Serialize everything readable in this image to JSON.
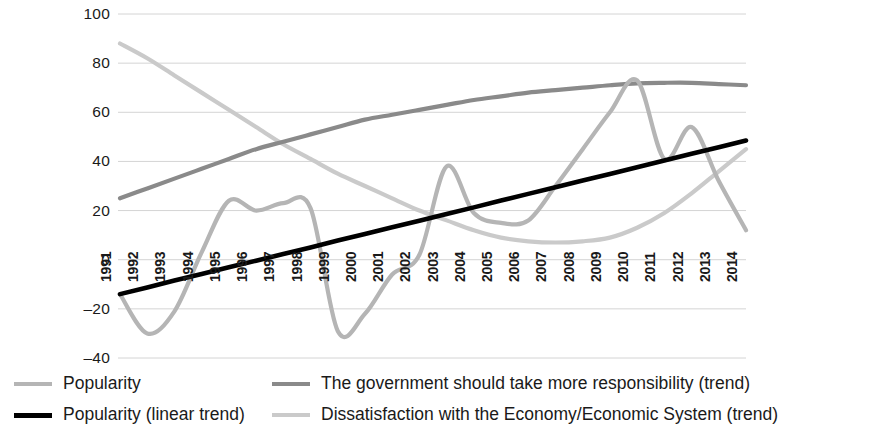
{
  "chart_data": {
    "type": "line",
    "title": "",
    "xlabel": "",
    "ylabel": "",
    "ylim": [
      -40,
      100
    ],
    "ytick_values": [
      100,
      80,
      60,
      40,
      20,
      0,
      -20,
      -40
    ],
    "ytick_labels": [
      "100",
      "80",
      "60",
      "40",
      "20",
      "0",
      "–20",
      "–40"
    ],
    "grid": true,
    "grid_axis": "y",
    "legend_position": "bottom",
    "x": [
      1991,
      1992,
      1993,
      1994,
      1995,
      1996,
      1997,
      1998,
      1999,
      2000,
      2001,
      2002,
      2003,
      2004,
      2005,
      2006,
      2007,
      2008,
      2009,
      2010,
      2011,
      2012,
      2013,
      2014
    ],
    "xtick_labels": [
      "1991",
      "1992",
      "1993",
      "1994",
      "1995",
      "1996",
      "1997",
      "1998",
      "1999",
      "2000",
      "2001",
      "2002",
      "2003",
      "2004",
      "2005",
      "2006",
      "2007",
      "2008",
      "2009",
      "2010",
      "2011",
      "2012",
      "2013",
      "2014"
    ],
    "series": [
      {
        "name": "Popularity",
        "color": "#b5b5b5",
        "width": 4.2,
        "smooth": true,
        "values": [
          -14,
          -30,
          -21,
          3,
          24,
          20,
          23,
          21,
          -29,
          -22,
          -6,
          2,
          38,
          19,
          15,
          16,
          30,
          45,
          60,
          73,
          41,
          54,
          32,
          12
        ]
      },
      {
        "name": "The government should take more responsibility (trend)",
        "color": "#8a8a8a",
        "width": 4.2,
        "smooth": true,
        "values": [
          25,
          29,
          33,
          37,
          41,
          45,
          48,
          51,
          54,
          57,
          59,
          61,
          63,
          65,
          66.5,
          68,
          69,
          70,
          71,
          71.8,
          72,
          72,
          71.5,
          71
        ]
      },
      {
        "name": "Popularity (linear trend)",
        "color": "#000000",
        "width": 4.6,
        "smooth": false,
        "values": [
          -14,
          -11.3,
          -8.5,
          -5.8,
          -3.1,
          -0.4,
          2.3,
          5,
          7.8,
          10.5,
          13.2,
          15.9,
          18.6,
          21.3,
          24.1,
          26.8,
          29.5,
          32.2,
          34.9,
          37.6,
          40.4,
          43.1,
          45.8,
          48.5
        ]
      },
      {
        "name": "Dissatisfaction with the Economy/Economic System (trend)",
        "color": "#cacaca",
        "width": 4.2,
        "smooth": true,
        "values": [
          88,
          82,
          75,
          68,
          61,
          54,
          47,
          41,
          35,
          30,
          25,
          20,
          16,
          12,
          9,
          7.5,
          7,
          7.5,
          9,
          13,
          19,
          27,
          36,
          45
        ]
      }
    ]
  },
  "legend": {
    "items": [
      {
        "label": "Popularity",
        "color": "#b5b5b5",
        "thickness": 4,
        "row": 0,
        "col": 0
      },
      {
        "label": "The government should take more responsibility (trend)",
        "color": "#8a8a8a",
        "thickness": 4,
        "row": 0,
        "col": 1
      },
      {
        "label": "Popularity (linear trend)",
        "color": "#000000",
        "thickness": 5,
        "row": 1,
        "col": 0
      },
      {
        "label": "Dissatisfaction with the Economy/Economic System (trend)",
        "color": "#cacaca",
        "thickness": 4,
        "row": 1,
        "col": 1
      }
    ]
  },
  "plot_geometry": {
    "left": 120,
    "right": 746,
    "top": 14,
    "bottom": 358,
    "grid_color": "#d4d4d4"
  }
}
